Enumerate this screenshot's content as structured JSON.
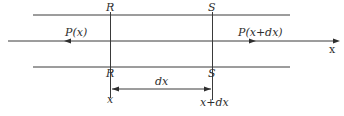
{
  "diagram": {
    "axis_label": "x",
    "sections": [
      {
        "id": "R",
        "top_label": "R",
        "bottom_label": "R",
        "position_label": "x"
      },
      {
        "id": "S",
        "top_label": "S",
        "bottom_label": "S",
        "position_label": "x+dx"
      }
    ],
    "forces": [
      {
        "label": "P(x)",
        "direction": "left"
      },
      {
        "label": "P(x+dx)",
        "direction": "right"
      }
    ],
    "dimension": {
      "label": "dx"
    },
    "colors": {
      "line": "#3a3a3a",
      "text": "#2e2e2e",
      "background": "#ffffff"
    }
  }
}
